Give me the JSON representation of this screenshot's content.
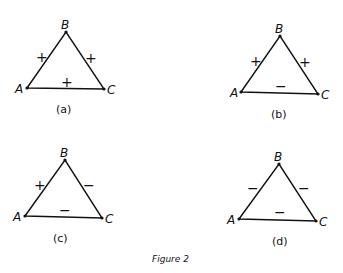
{
  "caption": "Figure 2",
  "diagrams": [
    {
      "id": "a",
      "label": "(a)",
      "vertices": {
        "A": "A",
        "B": "B",
        "C": "C"
      },
      "signs": {
        "AB": "+",
        "BC": "+",
        "AC": "+"
      }
    },
    {
      "id": "b",
      "label": "(b)",
      "vertices": {
        "A": "A",
        "B": "B",
        "C": "C"
      },
      "signs": {
        "AB": "+",
        "BC": "+",
        "AC": "−"
      }
    },
    {
      "id": "c",
      "label": "(c)",
      "vertices": {
        "A": "A",
        "B": "B",
        "C": "C"
      },
      "signs": {
        "AB": "+",
        "BC": "−",
        "AC": "−"
      }
    },
    {
      "id": "d",
      "label": "(d)",
      "vertices": {
        "A": "A",
        "B": "B",
        "C": "C"
      },
      "signs": {
        "AB": "−",
        "BC": "−",
        "AC": "−"
      }
    }
  ]
}
